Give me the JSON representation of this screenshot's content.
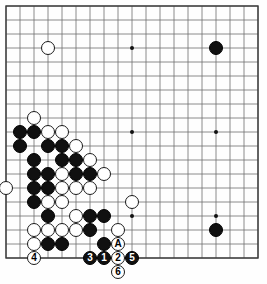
{
  "diagram": {
    "type": "go-board-diagram",
    "board_size": 19,
    "geometry": {
      "origin_x": 6,
      "origin_y": 6,
      "spacing": 14,
      "stone_radius": 7.2,
      "border_color": "#3a3a3a",
      "line_color": "#6e6e6e",
      "background_color": "#fefefe"
    },
    "star_points": [
      {
        "col": 4,
        "row": 4
      },
      {
        "col": 10,
        "row": 4
      },
      {
        "col": 16,
        "row": 4
      },
      {
        "col": 4,
        "row": 10
      },
      {
        "col": 10,
        "row": 10
      },
      {
        "col": 16,
        "row": 10
      },
      {
        "col": 4,
        "row": 16
      },
      {
        "col": 10,
        "row": 16
      },
      {
        "col": 16,
        "row": 16
      }
    ],
    "stones": [
      {
        "col": 4,
        "row": 4,
        "color": "white"
      },
      {
        "col": 16,
        "row": 4,
        "color": "black"
      },
      {
        "col": 3,
        "row": 9,
        "color": "white"
      },
      {
        "col": 2,
        "row": 10,
        "color": "black"
      },
      {
        "col": 3,
        "row": 10,
        "color": "black"
      },
      {
        "col": 4,
        "row": 10,
        "color": "white"
      },
      {
        "col": 5,
        "row": 10,
        "color": "white"
      },
      {
        "col": 2,
        "row": 11,
        "color": "black"
      },
      {
        "col": 4,
        "row": 11,
        "color": "black"
      },
      {
        "col": 5,
        "row": 11,
        "color": "black"
      },
      {
        "col": 6,
        "row": 11,
        "color": "white"
      },
      {
        "col": 3,
        "row": 12,
        "color": "black"
      },
      {
        "col": 5,
        "row": 12,
        "color": "black"
      },
      {
        "col": 6,
        "row": 12,
        "color": "black"
      },
      {
        "col": 7,
        "row": 12,
        "color": "white"
      },
      {
        "col": 3,
        "row": 13,
        "color": "black"
      },
      {
        "col": 4,
        "row": 13,
        "color": "black"
      },
      {
        "col": 5,
        "row": 13,
        "color": "white"
      },
      {
        "col": 6,
        "row": 13,
        "color": "black"
      },
      {
        "col": 7,
        "row": 13,
        "color": "black"
      },
      {
        "col": 8,
        "row": 13,
        "color": "white"
      },
      {
        "col": 1,
        "row": 14,
        "color": "white"
      },
      {
        "col": 3,
        "row": 14,
        "color": "black"
      },
      {
        "col": 4,
        "row": 14,
        "color": "black"
      },
      {
        "col": 5,
        "row": 14,
        "color": "white"
      },
      {
        "col": 6,
        "row": 14,
        "color": "white"
      },
      {
        "col": 7,
        "row": 14,
        "color": "white"
      },
      {
        "col": 3,
        "row": 15,
        "color": "black"
      },
      {
        "col": 4,
        "row": 15,
        "color": "white"
      },
      {
        "col": 5,
        "row": 15,
        "color": "white"
      },
      {
        "col": 10,
        "row": 15,
        "color": "white"
      },
      {
        "col": 4,
        "row": 16,
        "color": "black"
      },
      {
        "col": 6,
        "row": 16,
        "color": "white"
      },
      {
        "col": 7,
        "row": 16,
        "color": "black"
      },
      {
        "col": 8,
        "row": 16,
        "color": "black"
      },
      {
        "col": 3,
        "row": 17,
        "color": "white"
      },
      {
        "col": 4,
        "row": 17,
        "color": "white"
      },
      {
        "col": 5,
        "row": 17,
        "color": "white"
      },
      {
        "col": 6,
        "row": 17,
        "color": "white"
      },
      {
        "col": 7,
        "row": 17,
        "color": "black"
      },
      {
        "col": 9,
        "row": 17,
        "color": "white"
      },
      {
        "col": 16,
        "row": 17,
        "color": "black"
      },
      {
        "col": 3,
        "row": 18,
        "color": "white"
      },
      {
        "col": 4,
        "row": 18,
        "color": "black"
      },
      {
        "col": 5,
        "row": 18,
        "color": "black"
      },
      {
        "col": 8,
        "row": 18,
        "color": "black"
      },
      {
        "col": 9,
        "row": 18,
        "color": "white"
      }
    ],
    "numbered_stones": [
      {
        "label": "3",
        "col": 7,
        "row": 19,
        "color": "black"
      },
      {
        "label": "1",
        "col": 8,
        "row": 19,
        "color": "black"
      },
      {
        "label": "2",
        "col": 9,
        "row": 19,
        "color": "white"
      },
      {
        "label": "5",
        "col": 10,
        "row": 19,
        "color": "black"
      },
      {
        "label": "4",
        "col": 3,
        "row": 19,
        "color": "white"
      },
      {
        "label": "6",
        "col": 9,
        "row": 20,
        "color": "white"
      }
    ],
    "point_labels": [
      {
        "label": "A",
        "col": 9,
        "row": 18
      }
    ]
  }
}
